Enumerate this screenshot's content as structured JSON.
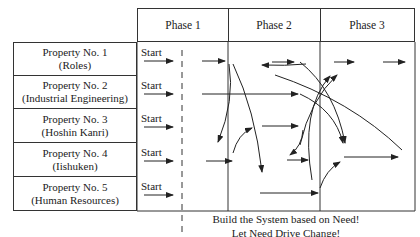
{
  "phases": [
    {
      "label": "Phase 1"
    },
    {
      "label": "Phase 2"
    },
    {
      "label": "Phase 3"
    }
  ],
  "properties": [
    {
      "name": "Property No. 1",
      "sub": "(Roles)",
      "start": "Start"
    },
    {
      "name": "Property No. 2",
      "sub": "(Industrial Engineering)",
      "start": "Start"
    },
    {
      "name": "Property No. 3",
      "sub": "(Hoshin Kanri)",
      "start": "Start"
    },
    {
      "name": "Property No. 4",
      "sub": "(Iishuken)",
      "start": "Start"
    },
    {
      "name": "Property No. 5",
      "sub": "(Human Resources)",
      "start": "Start"
    }
  ],
  "caption": {
    "line1": "Build the System based on Need!",
    "line2": "Let Need Drive Change!"
  },
  "colors": {
    "line": "#333333",
    "text": "#222222",
    "background": "#ffffff"
  }
}
